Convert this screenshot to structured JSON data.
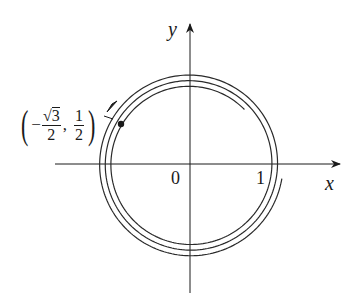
{
  "figure": {
    "type": "parametric-curve-spiral",
    "axes": {
      "x_label": "x",
      "y_label": "y",
      "origin_label": "0",
      "x_tick_label": "1"
    },
    "point": {
      "label_minus": "−",
      "label_x_num": "3",
      "label_x_den": "2",
      "label_sep": ",",
      "label_y_num": "1",
      "label_y_den": "2",
      "coords": "(−√3/2, 1/2)"
    },
    "colors": {
      "line": "#1a1a1a",
      "background": "#ffffff"
    }
  }
}
